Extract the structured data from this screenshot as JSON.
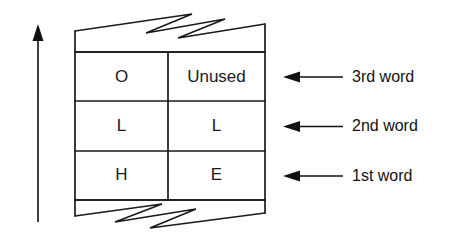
{
  "figure": {
    "background_color": "#ffffff",
    "line_color": "#1a1a1a",
    "text_color": "#111111"
  },
  "growth_arrow": {
    "name": "upward-growth-arrow",
    "direction": "up"
  },
  "memory_block": {
    "break_top": "zigzag-break",
    "break_bottom": "zigzag-break",
    "columns": 2,
    "rows": [
      {
        "label": "3rd word",
        "cells": [
          {
            "text": "O"
          },
          {
            "text": "Unused"
          }
        ]
      },
      {
        "label": "2nd word",
        "cells": [
          {
            "text": "L"
          },
          {
            "text": "L"
          }
        ]
      },
      {
        "label": "1st word",
        "cells": [
          {
            "text": "H"
          },
          {
            "text": "E"
          }
        ]
      }
    ]
  },
  "annotations": [
    {
      "name": "annotation-3rd-word",
      "text": "3rd word"
    },
    {
      "name": "annotation-2nd-word",
      "text": "2nd word"
    },
    {
      "name": "annotation-1st-word",
      "text": "1st word"
    }
  ]
}
